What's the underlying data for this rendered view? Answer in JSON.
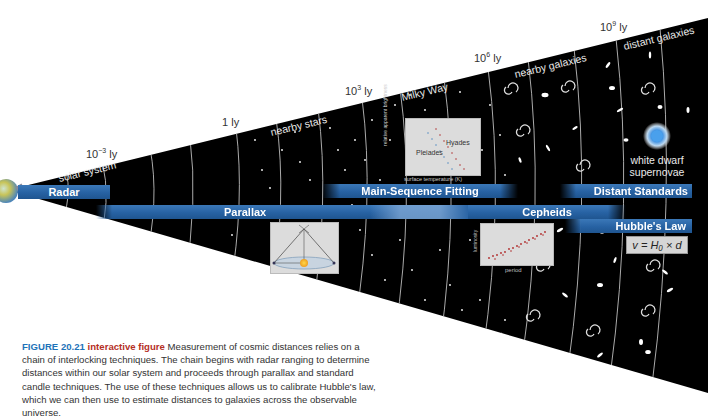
{
  "figure": {
    "scale_markers": [
      {
        "base": "10",
        "exp": "−3",
        "unit": "ly"
      },
      {
        "base": "1",
        "exp": "",
        "unit": "ly"
      },
      {
        "base": "10",
        "exp": "3",
        "unit": "ly"
      },
      {
        "base": "10",
        "exp": "6",
        "unit": "ly"
      },
      {
        "base": "10",
        "exp": "9",
        "unit": "ly"
      }
    ],
    "regions": [
      "solar system",
      "nearby stars",
      "Milky Way",
      "nearby galaxies",
      "distant galaxies"
    ],
    "techniques": [
      "Radar",
      "Parallax",
      "Main-Sequence Fitting",
      "Cepheids",
      "Distant Standards",
      "Hubble's Law"
    ],
    "insets": {
      "hr_diagram": {
        "y_label": "relative apparent brightness",
        "x_label": "surface temperature (K)",
        "cluster_1": "Hyades",
        "cluster_2": "Pleiades"
      },
      "cepheid_plot": {
        "y_label": "luminosity",
        "x_label": "period"
      }
    },
    "supernova_label_1": "white dwarf",
    "supernova_label_2": "supernovae",
    "formula": "v = H₀ × d"
  },
  "caption": {
    "number": "FIGURE 20.21",
    "tag": "interactive figure",
    "text": "Measurement of cosmic distances relies on a chain of interlocking techniques. The chain begins with radar ranging to determine distances within our solar system and proceeds through parallax and standard candle techniques. The use of these techniques allows us to calibrate Hubble's law, which we can then use to estimate distances to galaxies across the observable universe."
  },
  "colors": {
    "band_blue": "#2762a3",
    "cone_black": "#000000",
    "caption_number": "#1e73b9",
    "caption_tag": "#b5301f"
  }
}
